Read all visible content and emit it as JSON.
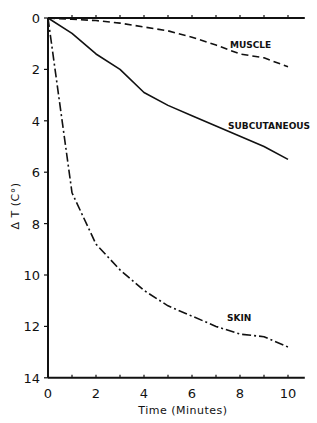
{
  "chart_data": {
    "type": "line",
    "title": "",
    "xlabel": "Time (Minutes)",
    "ylabel": "Δ T (C°)",
    "xlim": [
      0,
      10.7
    ],
    "ylim": [
      0,
      14
    ],
    "y_inverted": true,
    "grid": false,
    "legend_position": "inline labels",
    "x_ticks": [
      0,
      2,
      4,
      6,
      8,
      10
    ],
    "y_ticks": [
      0,
      2,
      4,
      6,
      8,
      10,
      12,
      14
    ],
    "x": [
      0,
      1,
      2,
      3,
      4,
      5,
      6,
      7,
      8,
      9,
      10
    ],
    "series": [
      {
        "name": "MUSCLE",
        "style": "dashed",
        "values": [
          0,
          0.05,
          0.1,
          0.2,
          0.35,
          0.5,
          0.75,
          1.05,
          1.4,
          1.55,
          1.9
        ]
      },
      {
        "name": "SUBCUTANEOUS",
        "style": "solid",
        "values": [
          0,
          0.6,
          1.4,
          2.0,
          2.9,
          3.4,
          3.8,
          4.2,
          4.6,
          5.0,
          5.5
        ]
      },
      {
        "name": "SKIN",
        "style": "dash-dot",
        "values": [
          0,
          6.8,
          8.8,
          9.8,
          10.6,
          11.2,
          11.6,
          12.0,
          12.3,
          12.4,
          12.8
        ]
      }
    ]
  },
  "labels": {
    "muscle": "MUSCLE",
    "subcutaneous": "SUBCUTANEOUS",
    "skin": "SKIN",
    "xlabel": "Time (Minutes)",
    "ylabel": "Δ T (C°)"
  }
}
